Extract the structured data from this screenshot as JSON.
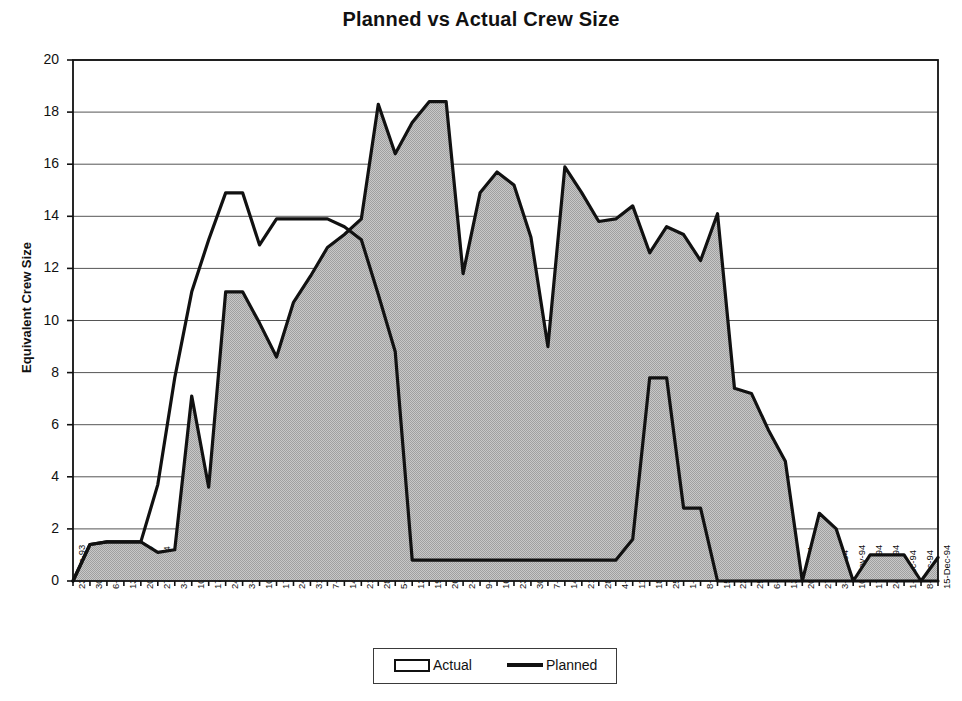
{
  "chart_data": {
    "type": "area",
    "title": "Planned vs Actual Crew Size",
    "xlabel": "",
    "ylabel": "Equivalent Crew Size",
    "ylim": [
      0,
      20
    ],
    "ytick_step": 2,
    "yticks": [
      20,
      18,
      16,
      14,
      12,
      10,
      8,
      6,
      4,
      2,
      0
    ],
    "grid": true,
    "grid_axis": "y",
    "legend_position": "bottom-center",
    "colors": {
      "actual_fill": "#b8b8b8",
      "actual_line": "#111111",
      "planned_line": "#111111",
      "axis": "#111111",
      "gridline": "#555555",
      "background": "#ffffff"
    },
    "categories": [
      "23-Dec-93",
      "30-Dec-93",
      "6-Jan-94",
      "13-Jan-94",
      "20-Jan-94",
      "27-Jan-94",
      "3-Feb-94",
      "10-Feb-94",
      "17-Feb-94",
      "24-Feb-94",
      "3-Mar-94",
      "10-Mar-94",
      "17-Mar-94",
      "24-Mar-94",
      "31-Mar-94",
      "7-Apr-94",
      "14-Apr-94",
      "21-Apr-94",
      "28-Apr-94",
      "5-May-94",
      "12-May-94",
      "19-May-94",
      "26-May-94",
      "2-Jun-94",
      "9-Jun-94",
      "16-Jun-94",
      "23-Jun-94",
      "30-Jun-94",
      "7-Jul-94",
      "14-Jul-94",
      "21-Jul-94",
      "28-Jul-94",
      "4-Aug-94",
      "11-Aug-94",
      "18-Aug-94",
      "25-Aug-94",
      "1-Sep-94",
      "8-Sep-94",
      "15-Sep-94",
      "22-Sep-94",
      "29-Sep-94",
      "6-Oct-94",
      "13-Oct-94",
      "20-Oct-94",
      "27-Oct-94",
      "3-Nov-94",
      "10-Nov-94",
      "17-Nov-94",
      "24-Nov-94",
      "1-Dec-94",
      "8-Dec-94",
      "15-Dec-94"
    ],
    "series": [
      {
        "name": "Actual",
        "style": "filled-area",
        "values": [
          0.0,
          1.4,
          1.5,
          1.5,
          1.5,
          1.1,
          1.2,
          7.1,
          3.6,
          11.1,
          11.1,
          9.9,
          8.6,
          10.7,
          11.7,
          12.8,
          13.3,
          13.9,
          18.3,
          16.4,
          17.6,
          18.4,
          18.4,
          11.8,
          14.9,
          15.7,
          15.2,
          13.2,
          9.0,
          15.9,
          14.9,
          13.8,
          13.9,
          14.4,
          12.6,
          13.6,
          13.3,
          12.3,
          14.1,
          7.4,
          7.2,
          5.8,
          4.6,
          0.0,
          2.6,
          2.0,
          0.0,
          1.0,
          1.0,
          1.0,
          0.0,
          0.9
        ]
      },
      {
        "name": "Planned",
        "style": "line",
        "values": [
          0.0,
          1.4,
          1.5,
          1.5,
          1.5,
          3.7,
          7.8,
          11.1,
          13.1,
          14.9,
          14.9,
          12.9,
          13.9,
          13.9,
          13.9,
          13.9,
          13.6,
          13.1,
          11.0,
          8.8,
          0.8,
          0.8,
          0.8,
          0.8,
          0.8,
          0.8,
          0.8,
          0.8,
          0.8,
          0.8,
          0.8,
          0.8,
          0.8,
          1.6,
          7.8,
          7.8,
          2.8,
          2.8,
          0.0,
          0.0,
          0.0,
          0.0,
          0.0,
          0.0,
          0.0,
          0.0,
          0.0,
          0.0,
          0.0,
          0.0,
          0.0,
          0.0
        ]
      }
    ]
  },
  "legend": {
    "actual_label": "Actual",
    "planned_label": "Planned"
  }
}
